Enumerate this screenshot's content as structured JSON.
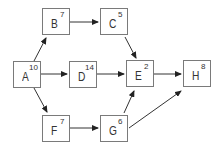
{
  "diagram": {
    "type": "activity-network",
    "nodes": [
      {
        "id": "A",
        "label": "A",
        "duration": "10"
      },
      {
        "id": "B",
        "label": "B",
        "duration": "7"
      },
      {
        "id": "C",
        "label": "C",
        "duration": "5"
      },
      {
        "id": "D",
        "label": "D",
        "duration": "14"
      },
      {
        "id": "E",
        "label": "E",
        "duration": "2"
      },
      {
        "id": "F",
        "label": "F",
        "duration": "7"
      },
      {
        "id": "G",
        "label": "G",
        "duration": "6"
      },
      {
        "id": "H",
        "label": "H",
        "duration": "8"
      }
    ],
    "edges": [
      {
        "from": "A",
        "to": "B"
      },
      {
        "from": "A",
        "to": "D"
      },
      {
        "from": "A",
        "to": "F"
      },
      {
        "from": "B",
        "to": "C"
      },
      {
        "from": "C",
        "to": "E"
      },
      {
        "from": "D",
        "to": "E"
      },
      {
        "from": "E",
        "to": "H"
      },
      {
        "from": "F",
        "to": "G"
      },
      {
        "from": "G",
        "to": "E"
      },
      {
        "from": "G",
        "to": "H"
      }
    ],
    "colors": {
      "stroke": "#7a7a7a",
      "text": "#333333",
      "arrow": "#222222"
    }
  }
}
